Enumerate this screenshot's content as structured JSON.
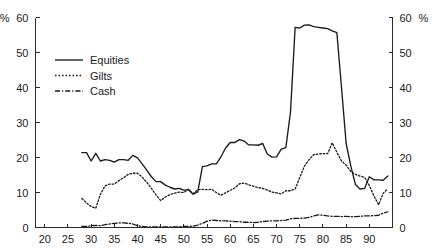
{
  "chart_data": {
    "type": "line",
    "title": "",
    "xlabel": "",
    "ylabel": "%",
    "left_axis_unit": "%",
    "right_axis_unit": "%",
    "grid": false,
    "legend_position": "upper-left",
    "xlim": [
      18,
      95
    ],
    "ylim": [
      0,
      60
    ],
    "xticks": [
      20,
      25,
      30,
      35,
      40,
      45,
      50,
      55,
      60,
      65,
      70,
      75,
      80,
      85,
      90
    ],
    "xtick_labels": [
      "20",
      "25",
      "30",
      "35",
      "40",
      "45",
      "50",
      "55",
      "60",
      "65",
      "70",
      "75",
      "80",
      "85",
      "90"
    ],
    "yticks": [
      0,
      10,
      20,
      30,
      40,
      50,
      60
    ],
    "ytick_labels_left": [
      "0",
      "10",
      "20",
      "30",
      "40",
      "50",
      "60"
    ],
    "ytick_labels_right": [
      "0",
      "10",
      "20",
      "30",
      "40",
      "50",
      "60"
    ],
    "x": [
      28,
      29,
      30,
      31,
      32,
      33,
      34,
      35,
      36,
      37,
      38,
      39,
      40,
      41,
      42,
      43,
      44,
      45,
      46,
      47,
      48,
      49,
      50,
      51,
      52,
      53,
      54,
      55,
      56,
      57,
      58,
      59,
      60,
      61,
      62,
      63,
      64,
      65,
      66,
      67,
      68,
      69,
      70,
      71,
      72,
      73,
      74,
      75,
      76,
      77,
      78,
      79,
      80,
      81,
      82,
      83,
      84,
      85,
      86,
      87,
      88,
      89,
      90,
      91,
      92,
      93,
      94
    ],
    "series": [
      {
        "name": "Equities",
        "style": "solid",
        "values": [
          21.4,
          21.4,
          19.0,
          21.2,
          19.0,
          19.4,
          19.2,
          18.7,
          19.4,
          19.4,
          19.2,
          20.6,
          19.9,
          18.2,
          16.4,
          14.5,
          13.1,
          13.1,
          12.1,
          11.5,
          11.0,
          11.2,
          10.7,
          10.8,
          9.5,
          10.2,
          17.4,
          17.6,
          18.2,
          18.2,
          20.2,
          22.7,
          24.3,
          24.3,
          25.1,
          24.7,
          23.6,
          23.6,
          23.5,
          24.0,
          21.0,
          20.1,
          20.2,
          22.4,
          22.8,
          33.0,
          57.2,
          57.0,
          57.8,
          57.9,
          57.4,
          57.2,
          57.0,
          56.8,
          56.2,
          55.7,
          40.0,
          24.0,
          17.6,
          12.3,
          11.0,
          11.2,
          14.5,
          13.6,
          13.6,
          13.5,
          14.7
        ]
      },
      {
        "name": "Gilts",
        "style": "dotted",
        "values": [
          8.3,
          7.0,
          6.0,
          5.5,
          9.5,
          11.9,
          12.4,
          12.4,
          13.4,
          14.2,
          15.2,
          15.5,
          15.5,
          14.4,
          12.9,
          11.2,
          9.3,
          7.7,
          8.7,
          9.4,
          9.8,
          10.1,
          10.0,
          10.9,
          9.7,
          10.8,
          10.9,
          10.8,
          10.9,
          10.0,
          9.2,
          9.9,
          10.6,
          11.3,
          12.5,
          12.7,
          12.2,
          11.8,
          11.4,
          11.2,
          10.7,
          10.1,
          9.9,
          9.6,
          10.5,
          10.5,
          11.0,
          14.3,
          17.5,
          19.4,
          20.8,
          21.0,
          21.1,
          21.1,
          24.2,
          21.5,
          19.0,
          17.8,
          16.0,
          15.2,
          14.7,
          14.3,
          12.0,
          9.0,
          6.5,
          9.8,
          11.1
        ]
      },
      {
        "name": "Cash",
        "style": "dash-dot",
        "values": [
          0.3,
          0.3,
          0.5,
          0.6,
          0.5,
          0.8,
          1.0,
          1.2,
          1.3,
          1.3,
          1.2,
          1.0,
          0.5,
          0.3,
          0.2,
          0.2,
          0.2,
          0.2,
          0.2,
          0.2,
          0.2,
          0.2,
          0.3,
          0.3,
          0.4,
          0.7,
          1.2,
          1.8,
          2.1,
          2.0,
          1.9,
          1.9,
          1.8,
          1.7,
          1.7,
          1.5,
          1.5,
          1.4,
          1.5,
          1.7,
          1.8,
          1.9,
          1.9,
          2.0,
          2.1,
          2.5,
          2.6,
          2.6,
          2.7,
          2.9,
          3.3,
          3.6,
          3.5,
          3.3,
          3.2,
          3.2,
          3.1,
          3.2,
          3.1,
          3.1,
          3.2,
          3.3,
          3.3,
          3.4,
          3.5,
          4.1,
          4.5
        ]
      }
    ],
    "legend": [
      {
        "label": "Equities",
        "style": "solid"
      },
      {
        "label": "Gilts",
        "style": "dotted"
      },
      {
        "label": "Cash",
        "style": "dash-dot"
      }
    ],
    "colors": {
      "line": "#1a1a1a",
      "axis": "#2b2b2b",
      "background": "#ffffff"
    }
  }
}
